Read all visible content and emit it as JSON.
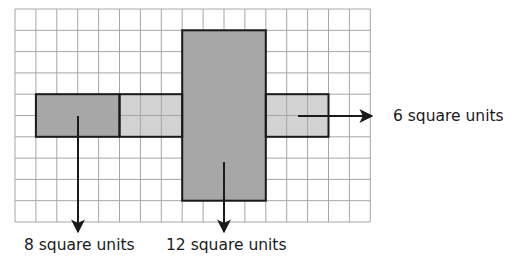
{
  "grid": {
    "cols": 17,
    "rows": 10,
    "origin_x": 15,
    "origin_y": 9,
    "cell_w": 20.9,
    "cell_h": 21.3,
    "line_color": "#a6a6a6",
    "background": "#ffffff"
  },
  "shapes": [
    {
      "name": "left-dark-rect",
      "col": 1,
      "row": 4,
      "w": 4,
      "h": 2,
      "fill": "#a7a7a7",
      "area": 8
    },
    {
      "name": "middle-light-rect",
      "col": 5,
      "row": 4,
      "w": 3,
      "h": 2,
      "fill": "#d2d2d2"
    },
    {
      "name": "center-vertical-rect",
      "col": 8,
      "row": 1,
      "w": 4,
      "h": 8,
      "fill": "#a7a7a7"
    },
    {
      "name": "right-light-rect",
      "col": 12,
      "row": 4,
      "w": 3,
      "h": 2,
      "fill": "#d2d2d2",
      "area": 6
    }
  ],
  "outline_color": "#1a1a1a",
  "annotations": [
    {
      "id": "right",
      "text": "6 square units",
      "value": 6,
      "unit": "square units"
    },
    {
      "id": "left",
      "text": "8 square units",
      "value": 8,
      "unit": "square units"
    },
    {
      "id": "center",
      "text": "12 square units",
      "value": 12,
      "unit": "square units"
    }
  ]
}
